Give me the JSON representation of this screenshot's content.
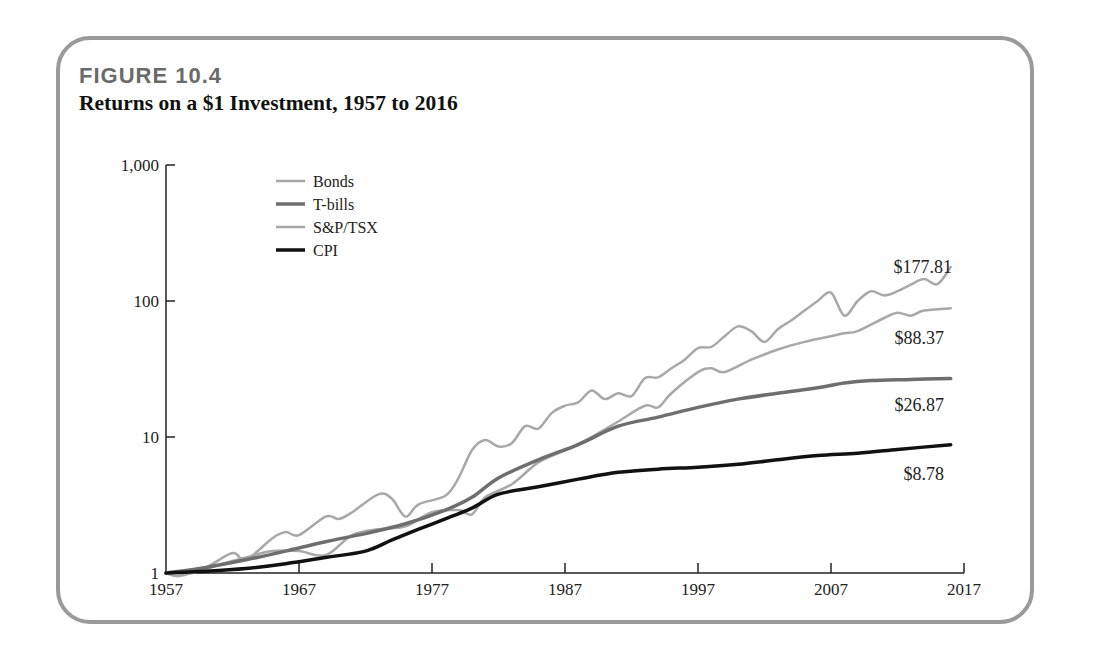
{
  "figure": {
    "label": "FIGURE 10.4",
    "title": "Returns on a $1 Investment, 1957 to 2016"
  },
  "legend": [
    {
      "name": "Bonds",
      "color": "#a8a8a8",
      "width": 2
    },
    {
      "name": "T-bills",
      "color": "#6e6e6e",
      "width": 3
    },
    {
      "name": "S&P/TSX",
      "color": "#a8a8a8",
      "width": 2
    },
    {
      "name": "CPI",
      "color": "#111111",
      "width": 3
    }
  ],
  "end_labels": [
    {
      "series": "S&P/TSX",
      "text": "$177.81"
    },
    {
      "series": "Bonds",
      "text": "$88.37"
    },
    {
      "series": "T-bills",
      "text": "$26.87"
    },
    {
      "series": "CPI",
      "text": "$8.78"
    }
  ],
  "chart_data": {
    "type": "line",
    "title": "Returns on a $1 Investment, 1957 to 2016",
    "xlabel": "",
    "ylabel": "",
    "yscale": "log",
    "ylim": [
      1,
      1000
    ],
    "xlim": [
      1957,
      2017
    ],
    "y_ticks": [
      1,
      10,
      100,
      1000
    ],
    "y_tick_labels": [
      "1",
      "10",
      "100",
      "1,000"
    ],
    "x_ticks": [
      1957,
      1967,
      1977,
      1987,
      1997,
      2007,
      2017
    ],
    "x_tick_labels": [
      "1957",
      "1967",
      "1977",
      "1987",
      "1997",
      "2007",
      "2017"
    ],
    "grid": false,
    "legend_position": "upper left",
    "series": [
      {
        "name": "S&P/TSX",
        "x": [
          1957,
          1958,
          1960,
          1962,
          1963,
          1965,
          1966,
          1967,
          1969,
          1970,
          1971,
          1973,
          1974,
          1975,
          1976,
          1978,
          1979,
          1980,
          1981,
          1982,
          1983,
          1984,
          1985,
          1986,
          1987,
          1988,
          1989,
          1990,
          1991,
          1992,
          1993,
          1994,
          1995,
          1996,
          1997,
          1998,
          1999,
          2000,
          2001,
          2002,
          2003,
          2004,
          2005,
          2006,
          2007,
          2008,
          2009,
          2010,
          2011,
          2012,
          2013,
          2014,
          2015,
          2016
        ],
        "values": [
          1.0,
          0.95,
          1.1,
          1.4,
          1.25,
          1.8,
          2.0,
          1.9,
          2.6,
          2.5,
          2.8,
          3.8,
          3.5,
          2.6,
          3.2,
          3.7,
          5.0,
          8.0,
          9.5,
          8.5,
          9.0,
          12.0,
          11.5,
          15.0,
          17.0,
          18.0,
          22.0,
          19.0,
          21.0,
          20.0,
          27.0,
          27.5,
          32.0,
          37.0,
          45.0,
          46.0,
          55.0,
          65.0,
          60.0,
          50.0,
          62.0,
          72.0,
          85.0,
          100.0,
          115.0,
          78.0,
          100.0,
          118.0,
          110.0,
          118.0,
          132.0,
          145.0,
          133.0,
          177.81
        ]
      },
      {
        "name": "Bonds",
        "x": [
          1957,
          1959,
          1961,
          1963,
          1965,
          1967,
          1969,
          1971,
          1973,
          1975,
          1977,
          1979,
          1980,
          1981,
          1983,
          1985,
          1987,
          1989,
          1991,
          1993,
          1994,
          1995,
          1997,
          1998,
          1999,
          2001,
          2003,
          2005,
          2007,
          2008,
          2009,
          2011,
          2012,
          2013,
          2014,
          2016
        ],
        "values": [
          1.0,
          1.0,
          1.15,
          1.3,
          1.45,
          1.45,
          1.35,
          1.9,
          2.1,
          2.2,
          2.8,
          2.9,
          2.7,
          3.6,
          4.5,
          6.5,
          8.0,
          10.0,
          13.0,
          17.0,
          16.5,
          21.0,
          30.0,
          32.0,
          30.0,
          37.0,
          44.0,
          50.0,
          55.0,
          58.0,
          60.0,
          75.0,
          82.0,
          78.0,
          85.0,
          88.37
        ]
      },
      {
        "name": "T-bills",
        "x": [
          1957,
          1960,
          1963,
          1966,
          1969,
          1972,
          1975,
          1978,
          1980,
          1982,
          1985,
          1988,
          1991,
          1994,
          1997,
          2000,
          2003,
          2006,
          2008,
          2010,
          2013,
          2016
        ],
        "values": [
          1.0,
          1.1,
          1.25,
          1.45,
          1.7,
          1.95,
          2.3,
          2.9,
          3.6,
          5.0,
          6.8,
          8.8,
          12.0,
          14.0,
          16.5,
          19.0,
          21.0,
          23.0,
          25.0,
          26.0,
          26.5,
          26.87
        ]
      },
      {
        "name": "CPI",
        "x": [
          1957,
          1960,
          1963,
          1966,
          1969,
          1972,
          1974,
          1976,
          1978,
          1980,
          1982,
          1985,
          1988,
          1991,
          1994,
          1997,
          2000,
          2003,
          2006,
          2009,
          2012,
          2016
        ],
        "values": [
          1.0,
          1.03,
          1.08,
          1.17,
          1.3,
          1.45,
          1.75,
          2.1,
          2.5,
          3.0,
          3.8,
          4.3,
          4.9,
          5.5,
          5.8,
          6.0,
          6.3,
          6.8,
          7.3,
          7.6,
          8.1,
          8.78
        ]
      }
    ]
  }
}
